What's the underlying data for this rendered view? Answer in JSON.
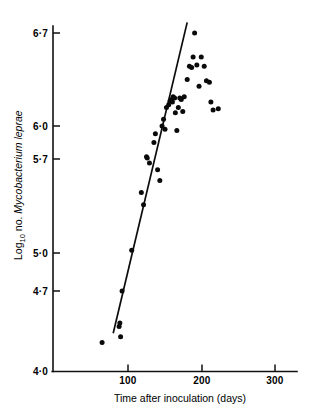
{
  "chart_data": {
    "type": "scatter",
    "title": "",
    "xlabel": "Time after inoculation (days)",
    "ylabel_prefix": "Log",
    "ylabel_subscript": "10",
    "ylabel_mid": " no. ",
    "ylabel_italic": "Mycobacterium leprae",
    "ylabel_full": "Log10 no. Mycobacterium leprae",
    "xlim": [
      0,
      330
    ],
    "ylim": [
      4.0,
      6.85
    ],
    "grid": false,
    "legend": "none",
    "xticks": [
      100,
      200,
      300
    ],
    "xtick_labels": [
      "100",
      "200",
      "300"
    ],
    "yticks": [
      4.0,
      4.7,
      5.0,
      5.7,
      6.0,
      6.7
    ],
    "ytick_labels": [
      "4·0",
      "4·7",
      "5·0",
      "5·7",
      "6·0",
      "6·7"
    ],
    "series": [
      {
        "name": "Mycobacterium leprae counts",
        "marker": "filled-circle",
        "points": [
          [
            65,
            4.25
          ],
          [
            88,
            4.39
          ],
          [
            89,
            4.42
          ],
          [
            90,
            4.3
          ],
          [
            92,
            4.7
          ],
          [
            105,
            5.02
          ],
          [
            118,
            5.45
          ],
          [
            121,
            5.36
          ],
          [
            125,
            5.72
          ],
          [
            126,
            5.71
          ],
          [
            129,
            5.67
          ],
          [
            135,
            5.85
          ],
          [
            137,
            5.93
          ],
          [
            140,
            5.62
          ],
          [
            143,
            5.54
          ],
          [
            146,
            6.0
          ],
          [
            148,
            6.05
          ],
          [
            150,
            5.97
          ],
          [
            152,
            6.14
          ],
          [
            155,
            6.16
          ],
          [
            157,
            6.19
          ],
          [
            159,
            6.2
          ],
          [
            160,
            6.18
          ],
          [
            161,
            6.22
          ],
          [
            163,
            6.21
          ],
          [
            164,
            6.1
          ],
          [
            166,
            5.96
          ],
          [
            168,
            6.14
          ],
          [
            170,
            6.21
          ],
          [
            172,
            6.2
          ],
          [
            174,
            6.11
          ],
          [
            176,
            6.22
          ],
          [
            180,
            6.35
          ],
          [
            183,
            6.45
          ],
          [
            186,
            6.44
          ],
          [
            188,
            6.52
          ],
          [
            190,
            6.7
          ],
          [
            193,
            6.46
          ],
          [
            196,
            6.3
          ],
          [
            199,
            6.52
          ],
          [
            203,
            6.45
          ],
          [
            206,
            6.34
          ],
          [
            210,
            6.33
          ],
          [
            212,
            6.18
          ],
          [
            215,
            6.12
          ],
          [
            222,
            6.13
          ]
        ]
      }
    ],
    "fit_line": {
      "name": "regression line",
      "x_start": 80,
      "y_start": 4.33,
      "x_end": 180,
      "y_end": 6.78
    }
  }
}
